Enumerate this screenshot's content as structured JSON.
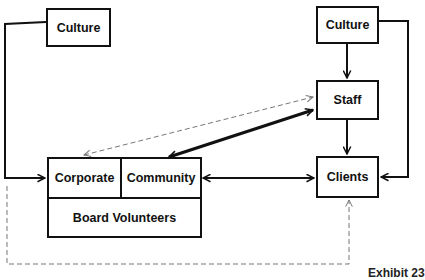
{
  "diagram": {
    "nodes": {
      "culture_left": {
        "label": "Culture"
      },
      "culture_right": {
        "label": "Culture"
      },
      "staff": {
        "label": "Staff"
      },
      "clients": {
        "label": "Clients"
      },
      "corporate": {
        "label": "Corporate"
      },
      "community": {
        "label": "Community"
      },
      "board_volunteers": {
        "label": "Board Volunteers"
      }
    },
    "edges": [
      {
        "from": "culture_left",
        "to": "corporate",
        "style": "solid",
        "arrow": "end"
      },
      {
        "from": "culture_right",
        "to": "staff",
        "style": "solid",
        "arrow": "end"
      },
      {
        "from": "culture_right",
        "to": "clients",
        "style": "solid",
        "arrow": "end"
      },
      {
        "from": "staff",
        "to": "clients",
        "style": "solid",
        "arrow": "end"
      },
      {
        "from": "staff",
        "to": "community",
        "style": "solid-bold",
        "arrow": "both"
      },
      {
        "from": "community",
        "to": "clients",
        "style": "solid",
        "arrow": "both"
      },
      {
        "from": "staff",
        "to": "corporate",
        "style": "dashed",
        "arrow": "both"
      },
      {
        "from": "board_volunteers",
        "to": "clients",
        "style": "dashed",
        "arrow": "end"
      }
    ],
    "caption": "Exhibit 23"
  }
}
